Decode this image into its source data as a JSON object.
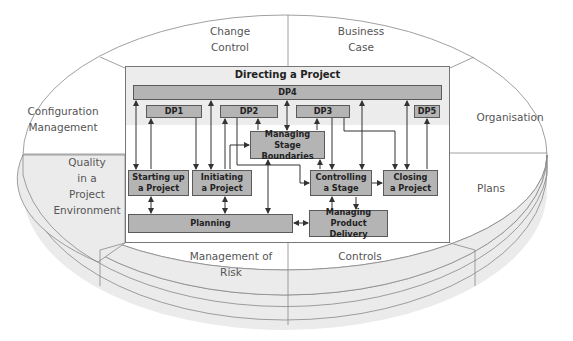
{
  "diagram": {
    "outer_components": {
      "change_control": [
        "Change",
        "Control"
      ],
      "business_case": [
        "Business",
        "Case"
      ],
      "configuration_management": [
        "Configuration",
        "Management"
      ],
      "organisation": [
        "Organisation"
      ],
      "quality": [
        "Quality",
        "in a",
        "Project",
        "Environment"
      ],
      "plans": [
        "Plans"
      ],
      "management_of_risk": [
        "Management of",
        "Risk"
      ],
      "controls": [
        "Controls"
      ]
    },
    "directing": {
      "title": "Directing a Project",
      "dp4": "DP4",
      "dp1": "DP1",
      "dp2": "DP2",
      "dp3": "DP3",
      "dp5": "DP5"
    },
    "processes": {
      "starting_up": [
        "Starting up",
        "a Project"
      ],
      "initiating": [
        "Initiating",
        "a Project"
      ],
      "managing_stage_boundaries": [
        "Managing Stage",
        "Boundaries"
      ],
      "controlling_stage": [
        "Controlling",
        "a Stage"
      ],
      "closing": [
        "Closing",
        "a Project"
      ],
      "planning": "Planning",
      "managing_product_delivery": [
        "Managing Product",
        "Delivery"
      ]
    },
    "colors": {
      "process_box_fill": "#b4b4b4",
      "directing_band_fill": "#ececec",
      "shaded_segment_fill": "#ebebeb",
      "line": "#777777",
      "text": "#555555"
    }
  }
}
